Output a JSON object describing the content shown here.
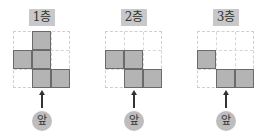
{
  "floors": [
    {
      "label": "1층",
      "filled": [
        [
          0,
          1
        ],
        [
          1,
          0
        ],
        [
          1,
          1
        ],
        [
          2,
          1
        ],
        [
          2,
          2
        ]
      ],
      "front_label": "앞"
    },
    {
      "label": "2층",
      "filled": [
        [
          1,
          0
        ],
        [
          1,
          1
        ],
        [
          2,
          1
        ],
        [
          2,
          2
        ]
      ],
      "front_label": "앞"
    },
    {
      "label": "3층",
      "filled": [
        [
          1,
          0
        ],
        [
          2,
          1
        ],
        [
          2,
          2
        ]
      ],
      "front_label": "앞"
    }
  ],
  "colors": {
    "filled_cell": "#b4b4b4",
    "label_bg": "#c8c8c8",
    "grid_line": "#cfcfcf"
  }
}
